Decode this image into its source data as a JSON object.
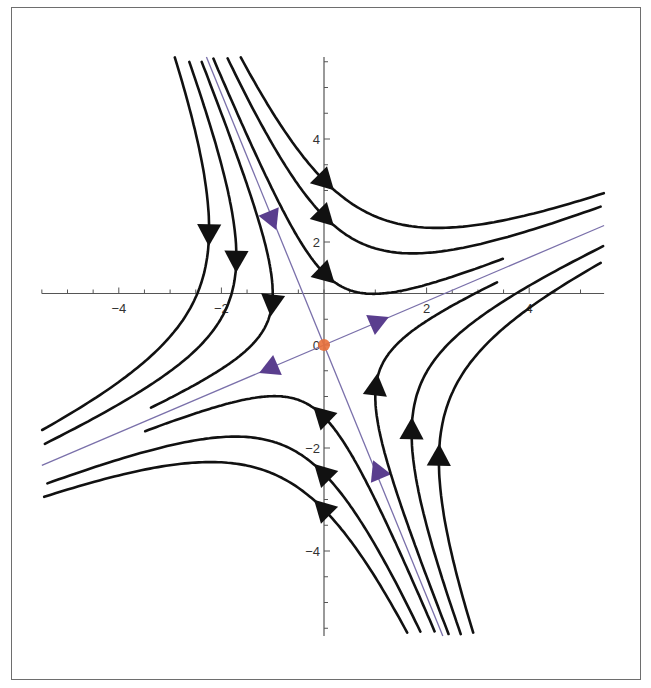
{
  "chart_data": {
    "type": "line",
    "subtype": "phase-portrait-streamlines",
    "title": "",
    "xlabel": "",
    "ylabel": "",
    "xlim": [
      -5.5,
      5.46
    ],
    "ylim": [
      -5.65,
      5.59
    ],
    "axes_origin": [
      0,
      1
    ],
    "grid": false,
    "x_ticks": [
      {
        "value": -4,
        "label": "−4"
      },
      {
        "value": -2,
        "label": "−2"
      },
      {
        "value": 2,
        "label": "2"
      },
      {
        "value": 4,
        "label": "4"
      }
    ],
    "y_ticks": [
      {
        "value": 4,
        "label": "4"
      },
      {
        "value": 2,
        "label": "2"
      },
      {
        "value": 0,
        "label": "0"
      },
      {
        "value": -2,
        "label": "−2"
      },
      {
        "value": -4,
        "label": "−4"
      }
    ],
    "equilibrium": {
      "x": 0,
      "y": 0,
      "type": "saddle",
      "color": "#e8703a"
    },
    "eigenvectors": {
      "unstable": [
        1,
        0.425
      ],
      "stable": [
        0.41,
        -1
      ]
    },
    "separatrices": {
      "color": "#7a70aa",
      "arrow_color": "#5a3e8e",
      "arrows": [
        {
          "x": 1.05,
          "y": 0.45,
          "dir": "out"
        },
        {
          "x": -1.05,
          "y": -0.45,
          "dir": "out"
        },
        {
          "x": -1.02,
          "y": 2.45,
          "dir": "in"
        },
        {
          "x": 1.05,
          "y": -2.45,
          "dir": "in"
        }
      ]
    },
    "streamlines": [
      {
        "family": "upper-right",
        "c": -3.04,
        "arrow": [
          0,
          3.2
        ],
        "tau": [
          -3,
          3
        ]
      },
      {
        "family": "upper-right",
        "c": -1.86,
        "arrow": [
          0,
          2.5
        ],
        "tau": [
          -3,
          3
        ]
      },
      {
        "family": "upper-right",
        "c": -0.58,
        "arrow": [
          0,
          1.35
        ],
        "tau": [
          -3,
          1.55
        ]
      },
      {
        "family": "upper-left",
        "c": 3.06,
        "arrow": [
          -2.24,
          2.19
        ],
        "tau": [
          -3,
          3
        ]
      },
      {
        "family": "upper-left",
        "c": 1.78,
        "arrow": [
          -1.71,
          1.65
        ],
        "tau": [
          -3,
          3
        ]
      },
      {
        "family": "upper-left",
        "c": 0.61,
        "arrow": [
          -1.01,
          0.82
        ],
        "tau": [
          -3,
          1.45
        ]
      },
      {
        "family": "lower-left",
        "c": -3.04,
        "arrow": [
          0,
          -3.2
        ],
        "tau": [
          -3,
          3
        ]
      },
      {
        "family": "lower-left",
        "c": -1.86,
        "arrow": [
          0,
          -2.5
        ],
        "tau": [
          -3,
          3
        ]
      },
      {
        "family": "lower-left",
        "c": -0.58,
        "arrow": [
          0,
          -1.35
        ],
        "tau": [
          -3,
          1.55
        ]
      },
      {
        "family": "lower-right",
        "c": 3.06,
        "arrow": [
          2.24,
          -2.19
        ],
        "tau": [
          -3,
          3
        ]
      },
      {
        "family": "lower-right",
        "c": 1.78,
        "arrow": [
          1.71,
          -1.65
        ],
        "tau": [
          -3,
          3
        ]
      },
      {
        "family": "lower-right",
        "c": 0.61,
        "arrow": [
          1.01,
          -0.82
        ],
        "tau": [
          -3,
          1.45
        ]
      }
    ],
    "line_color": "#111111"
  },
  "layout": {
    "px_per_unit_x": 51.3,
    "px_per_unit_y": 51.5,
    "origin_px": [
      324,
      345
    ]
  }
}
